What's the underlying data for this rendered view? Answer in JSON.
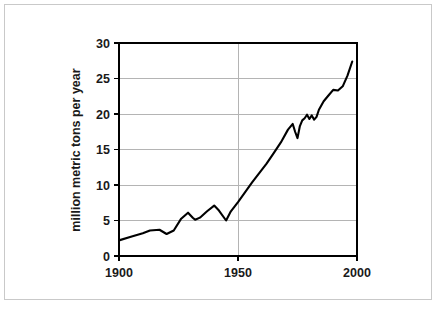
{
  "chart_data": {
    "type": "line",
    "title": "",
    "subtitle": "",
    "xlabel": "",
    "ylabel": "million metric tons per year",
    "xlim": [
      1900,
      2000
    ],
    "ylim": [
      0,
      30
    ],
    "xticks": [
      1900,
      1950,
      2000
    ],
    "xtick_labels": [
      "1900",
      "1950",
      "2000"
    ],
    "yticks": [
      0,
      5,
      10,
      15,
      20,
      25,
      30
    ],
    "ytick_labels": [
      "0",
      "5",
      "10",
      "15",
      "20",
      "25",
      "30"
    ],
    "grid": {
      "horizontal": true,
      "vertical": true,
      "color": "#b4b4b4"
    },
    "legend": {
      "visible": false,
      "position": "none"
    },
    "line_color": "#000000",
    "background_color": "#ffffff",
    "frame_border_color": "#c9c9c9",
    "series": [
      {
        "name": "production",
        "x": [
          1900,
          1905,
          1910,
          1913,
          1917,
          1920,
          1923,
          1926,
          1929,
          1931,
          1932,
          1934,
          1937,
          1940,
          1942,
          1945,
          1947,
          1950,
          1953,
          1956,
          1959,
          1962,
          1965,
          1968,
          1971,
          1973,
          1974,
          1975,
          1976,
          1977,
          1978,
          1979,
          1980,
          1981,
          1982,
          1983,
          1984,
          1985,
          1986,
          1988,
          1990,
          1992,
          1994,
          1996,
          1998
        ],
        "values": [
          2.2,
          2.7,
          3.2,
          3.6,
          3.7,
          3.1,
          3.6,
          5.2,
          6.1,
          5.4,
          5.1,
          5.4,
          6.3,
          7.1,
          6.4,
          5.0,
          6.3,
          7.6,
          9.0,
          10.4,
          11.7,
          13.0,
          14.5,
          16.0,
          17.8,
          18.6,
          17.5,
          16.6,
          18.3,
          19.1,
          19.4,
          19.9,
          19.3,
          19.8,
          19.2,
          19.6,
          20.6,
          21.2,
          21.8,
          22.6,
          23.4,
          23.3,
          23.9,
          25.4,
          27.4
        ]
      }
    ]
  },
  "axis": {
    "y_title": "million metric tons per year"
  }
}
